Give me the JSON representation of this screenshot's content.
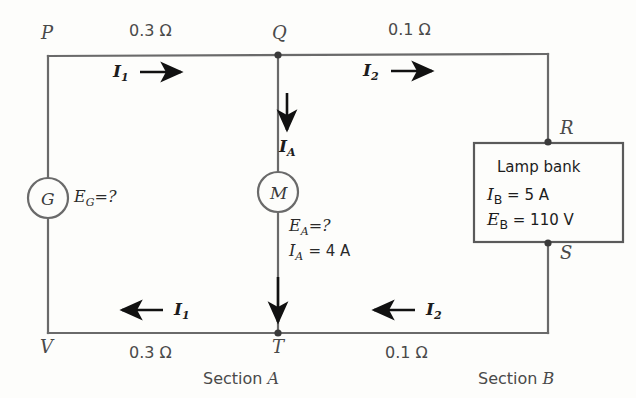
{
  "diagram": {
    "stroke_color": "#6a6a6a",
    "text_color": "#3a3a3a",
    "arrow_color": "#111111",
    "nodes": {
      "p": "P",
      "q": "Q",
      "r": "R",
      "s": "S",
      "t": "T",
      "v": "V"
    },
    "resistances": {
      "top_left": "0.3 Ω",
      "top_right": "0.1 Ω",
      "bottom_left": "0.3 Ω",
      "bottom_right": "0.1 Ω"
    },
    "currents": {
      "i1_top": "I",
      "i1_top_sub": "1",
      "i2_top": "I",
      "i2_top_sub": "2",
      "i1_bottom": "I",
      "i1_bottom_sub": "1",
      "i2_bottom": "I",
      "i2_bottom_sub": "2",
      "ia_top": "I",
      "ia_top_sub": "A"
    },
    "generator": {
      "symbol": "G",
      "emf_label": "E",
      "emf_sub": "G",
      "emf_value": "=?"
    },
    "motor": {
      "symbol": "M",
      "emf_label": "E",
      "emf_sub": "A",
      "emf_value": "=?",
      "current_label": "I",
      "current_sub": "A",
      "current_value": "= 4 A"
    },
    "lamp_bank": {
      "title": "Lamp bank",
      "current_sym": "I",
      "current_sub": "B",
      "current_value": "= 5 A",
      "emf_sym": "E",
      "emf_sub": "B",
      "emf_value": "= 110 V"
    },
    "sections": {
      "a": "Section A",
      "b": "Section B"
    }
  }
}
